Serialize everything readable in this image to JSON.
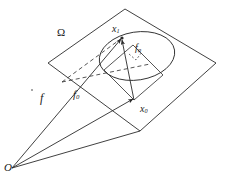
{
  "figure": {
    "type": "geometric-diagram",
    "background_color": "#ffffff",
    "stroke_color": "#2b2b2b",
    "labels": {
      "plane": "Ω",
      "point_on_circle": "x",
      "point_on_circle_sub": "1",
      "radial_vector": "f",
      "radial_vector_sub": "φ",
      "vector_f": "f",
      "vector_f0": "f",
      "vector_f0_sub": "0",
      "point_center": "x",
      "point_center_sub": "0",
      "origin": "O"
    },
    "geometry": {
      "plane_polygon": [
        [
          125,
          9
        ],
        [
          216,
          63
        ],
        [
          140,
          131
        ],
        [
          48,
          63
        ]
      ],
      "ellipse": {
        "cx": 137,
        "cy": 56,
        "rx": 38,
        "ry": 24,
        "rotation_deg": -9
      },
      "origin_point": [
        12,
        168
      ],
      "point_x0": [
        134,
        100
      ],
      "point_x1": [
        122,
        38
      ],
      "right_angle_marker": [
        [
          104,
          70
        ],
        [
          134,
          100
        ],
        [
          163,
          75
        ]
      ],
      "vectors": [
        {
          "name": "f",
          "from": [
            12,
            168
          ],
          "to": [
            122,
            38
          ],
          "style": "solid",
          "arrow": true
        },
        {
          "name": "f0",
          "from": [
            12,
            168
          ],
          "to": [
            134,
            100
          ],
          "style": "solid",
          "arrow": true
        },
        {
          "name": "fphi",
          "from": [
            134,
            100
          ],
          "to": [
            122,
            38
          ],
          "style": "solid",
          "arrow": true
        },
        {
          "name": "chord-dashed",
          "from": [
            66,
            79
          ],
          "to": [
            122,
            38
          ],
          "style": "dashed",
          "arrow": false
        },
        {
          "name": "radius-dashed",
          "from": [
            66,
            79
          ],
          "to": [
            137,
            56
          ],
          "style": "dashed",
          "arrow": false
        }
      ]
    }
  }
}
